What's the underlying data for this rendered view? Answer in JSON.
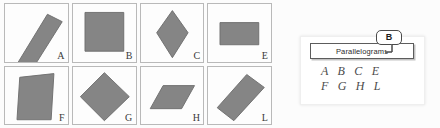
{
  "worksheet": {
    "grid": {
      "rows": 2,
      "columns": 4,
      "cells": [
        {
          "letter": "A",
          "shape_name": "tilted-narrow-rectangle",
          "icon": "parallelogram-icon",
          "points": "46,10 62,18 28,72 13,64"
        },
        {
          "letter": "B",
          "shape_name": "square",
          "icon": "square-icon",
          "points": "13,8 55,8 55,50 13,50"
        },
        {
          "letter": "C",
          "shape_name": "rhombus-vertical",
          "icon": "rhombus-icon",
          "points": "34,6 51,30 34,57 17,30"
        },
        {
          "letter": "E",
          "shape_name": "rectangle-horizontal",
          "icon": "rectangle-icon",
          "points": "13,19 55,19 55,43 13,43"
        },
        {
          "letter": "F",
          "shape_name": "slanted-parallelogram-tall",
          "icon": "parallelogram-icon",
          "points": "16,10 53,6 50,56 13,56"
        },
        {
          "letter": "G",
          "shape_name": "rotated-square-diamond",
          "icon": "diamond-icon",
          "points": "34,5 61,31 34,57 8,31"
        },
        {
          "letter": "H",
          "shape_name": "slanted-parallelogram-wide",
          "icon": "parallelogram-icon",
          "points": "24,19 58,19 44,44 10,44"
        },
        {
          "letter": "L",
          "shape_name": "rotated-rectangle",
          "icon": "rectangle-icon",
          "points": "42,7 61,21 28,57 10,43"
        }
      ]
    }
  },
  "answer_card": {
    "category_label": "Parallelograms",
    "answer_rows": [
      "A B C E",
      "F G H L"
    ]
  },
  "callout": {
    "badge_letter": "B"
  },
  "colors": {
    "shape_fill": "#858585",
    "shape_stroke": "#6e6e6e",
    "cell_border": "#b9b9b9",
    "card_background": "#ffffff",
    "label_border": "#5c5c5c",
    "text": "#2b2b2b"
  }
}
